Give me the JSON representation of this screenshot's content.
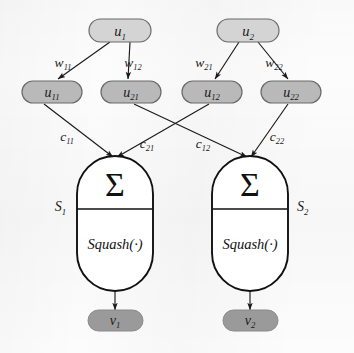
{
  "figure": {
    "background_color": "#fcfcfc",
    "line_color": "#1a1a1a"
  },
  "colors": {
    "input_node_fill": "#d4d4d4",
    "hidden_node_fill": "#b9b9b9",
    "output_node_fill": "#9a9a9a",
    "node_stroke": "#6a6a6a",
    "unit_fill": "#ffffff",
    "unit_stroke": "#111111"
  },
  "input_nodes": [
    {
      "id": "u1",
      "base": "u",
      "subscript": "1",
      "cx": 120,
      "cy": 31
    },
    {
      "id": "u2",
      "base": "u",
      "subscript": "2",
      "cx": 248,
      "cy": 31
    }
  ],
  "weight_labels": [
    {
      "id": "w11",
      "base": "w",
      "subscript": "11",
      "x": 63,
      "y": 67
    },
    {
      "id": "w12",
      "base": "w",
      "subscript": "12",
      "x": 133,
      "y": 67
    },
    {
      "id": "w21",
      "base": "w",
      "subscript": "21",
      "x": 204,
      "y": 67
    },
    {
      "id": "w22",
      "base": "w",
      "subscript": "22",
      "x": 274,
      "y": 67
    }
  ],
  "hidden_nodes": [
    {
      "id": "u11",
      "base": "u",
      "subscript": "11",
      "cx": 52,
      "cy": 92
    },
    {
      "id": "u21",
      "base": "u",
      "subscript": "21",
      "cx": 131,
      "cy": 92
    },
    {
      "id": "u12",
      "base": "u",
      "subscript": "12",
      "cx": 212,
      "cy": 92
    },
    {
      "id": "u22",
      "base": "u",
      "subscript": "22",
      "cx": 291,
      "cy": 92
    }
  ],
  "c_labels": [
    {
      "id": "c11",
      "base": "c",
      "subscript": "11",
      "x": 67,
      "y": 141
    },
    {
      "id": "c21",
      "base": "c",
      "subscript": "21",
      "x": 147,
      "y": 147
    },
    {
      "id": "c12",
      "base": "c",
      "subscript": "12",
      "x": 203,
      "y": 147
    },
    {
      "id": "c22",
      "base": "c",
      "subscript": "22",
      "x": 277,
      "y": 141
    }
  ],
  "units": [
    {
      "id": "unit1",
      "sum_symbol": "Σ",
      "squash_label": "Squash(·)",
      "state_label_base": "S",
      "state_label_subscript": "1",
      "x": 77,
      "y": 156,
      "width": 76,
      "height": 135,
      "state_label_x": 66,
      "state_label_y": 206
    },
    {
      "id": "unit2",
      "sum_symbol": "Σ",
      "squash_label": "Squash(·)",
      "state_label_base": "S",
      "state_label_subscript": "2",
      "x": 212,
      "y": 156,
      "width": 76,
      "height": 135,
      "state_label_x": 297,
      "state_label_y": 206
    }
  ],
  "output_nodes": [
    {
      "id": "v1",
      "base": "v",
      "subscript": "1",
      "cx": 115,
      "cy": 320
    },
    {
      "id": "v2",
      "base": "v",
      "subscript": "2",
      "cx": 250,
      "cy": 320
    }
  ],
  "edges": [
    {
      "id": "u1-u11",
      "from": "u1",
      "to": "u11",
      "label": "w11"
    },
    {
      "id": "u1-u21",
      "from": "u1",
      "to": "u21",
      "label": "w12"
    },
    {
      "id": "u2-u12",
      "from": "u2",
      "to": "u12",
      "label": "w21"
    },
    {
      "id": "u2-u22",
      "from": "u2",
      "to": "u22",
      "label": "w22"
    },
    {
      "id": "u11-unit1",
      "from": "u11",
      "to": "unit1",
      "label": "c11"
    },
    {
      "id": "u21-unit2",
      "from": "u21",
      "to": "unit2",
      "label": "c21"
    },
    {
      "id": "u12-unit1",
      "from": "u12",
      "to": "unit1",
      "label": "c12"
    },
    {
      "id": "u22-unit2",
      "from": "u22",
      "to": "unit2",
      "label": "c22"
    },
    {
      "id": "unit1-v1",
      "from": "unit1",
      "to": "v1"
    },
    {
      "id": "unit2-v2",
      "from": "unit2",
      "to": "v2"
    }
  ]
}
